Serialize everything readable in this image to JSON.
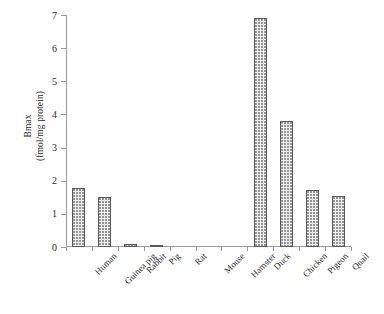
{
  "chart_data": {
    "type": "bar",
    "title": "",
    "subtitle": "",
    "xlabel": "",
    "ylabel": "Bmax (fmol/mg protein)",
    "ylabel_lines": [
      "Bmax",
      "(fmol/mg protein)"
    ],
    "categories": [
      "Human",
      "Guinea pig",
      "Rabbit",
      "Pig",
      "Rat",
      "Mouse",
      "Hamster",
      "Duck",
      "Chicken",
      "Pigeon",
      "Quail"
    ],
    "values": [
      1.78,
      1.51,
      0.09,
      0.06,
      0,
      0,
      0,
      6.9,
      3.81,
      1.72,
      1.54
    ],
    "ylim": [
      0,
      7
    ],
    "ytick_values": [
      0,
      1,
      2,
      3,
      4,
      5,
      6,
      7
    ],
    "ytick_labels": [
      "0",
      "1",
      "2",
      "3",
      "4",
      "5",
      "6",
      "7"
    ],
    "grid": false,
    "legend": false,
    "legend_position": "none",
    "bar_fill": "#f0f0f0",
    "bar_pattern": "dotted-stipple",
    "bar_edge_color": "#5a5a5a",
    "axis_color": "#9a9a9a",
    "background": "#ffffff"
  }
}
